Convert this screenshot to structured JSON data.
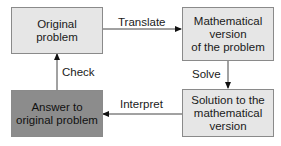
{
  "diagram": {
    "nodes": [
      {
        "id": "original",
        "label": "Original\nproblem",
        "fill": "#e6e6e6"
      },
      {
        "id": "math",
        "label": "Mathematical\nversion\nof the problem",
        "fill": "#e6e6e6"
      },
      {
        "id": "solution",
        "label": "Solution to the\nmathematical\nversion",
        "fill": "#e6e6e6"
      },
      {
        "id": "answer",
        "label": "Answer to\noriginal problem",
        "fill": "#8c8c8c"
      }
    ],
    "edges": [
      {
        "from": "original",
        "to": "math",
        "label": "Translate"
      },
      {
        "from": "math",
        "to": "solution",
        "label": "Solve"
      },
      {
        "from": "solution",
        "to": "answer",
        "label": "Interpret"
      },
      {
        "from": "answer",
        "to": "original",
        "label": "Check"
      }
    ]
  }
}
